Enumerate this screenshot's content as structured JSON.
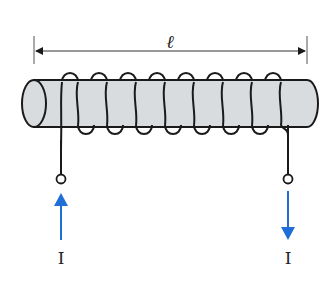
{
  "diagram": {
    "length_label": "ℓ",
    "current_in_label": "I",
    "current_out_label": "I",
    "turns": 8,
    "colors": {
      "core_fill": "#d9dcdf",
      "wire": "#1a1a1a",
      "arrow": "#1f6fd6",
      "background": "#ffffff"
    }
  }
}
